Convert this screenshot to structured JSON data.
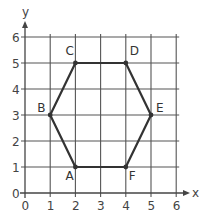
{
  "diagram": {
    "type": "coordinate-grid-polygon",
    "x_axis": {
      "label": "x",
      "min": 0,
      "max": 6,
      "ticks": [
        "0",
        "1",
        "2",
        "3",
        "4",
        "5",
        "6"
      ]
    },
    "y_axis": {
      "label": "y",
      "min": 0,
      "max": 6,
      "ticks": [
        "0",
        "1",
        "2",
        "3",
        "4",
        "5",
        "6"
      ]
    },
    "polygon": {
      "name": "hexagon ABCDEF",
      "vertices": [
        {
          "label": "A",
          "x": 2,
          "y": 1
        },
        {
          "label": "B",
          "x": 1,
          "y": 3
        },
        {
          "label": "C",
          "x": 2,
          "y": 5
        },
        {
          "label": "D",
          "x": 4,
          "y": 5
        },
        {
          "label": "E",
          "x": 5,
          "y": 3
        },
        {
          "label": "F",
          "x": 4,
          "y": 1
        }
      ]
    },
    "colors": {
      "grid": "#555555",
      "polygon": "#333333",
      "text": "#444444"
    }
  }
}
